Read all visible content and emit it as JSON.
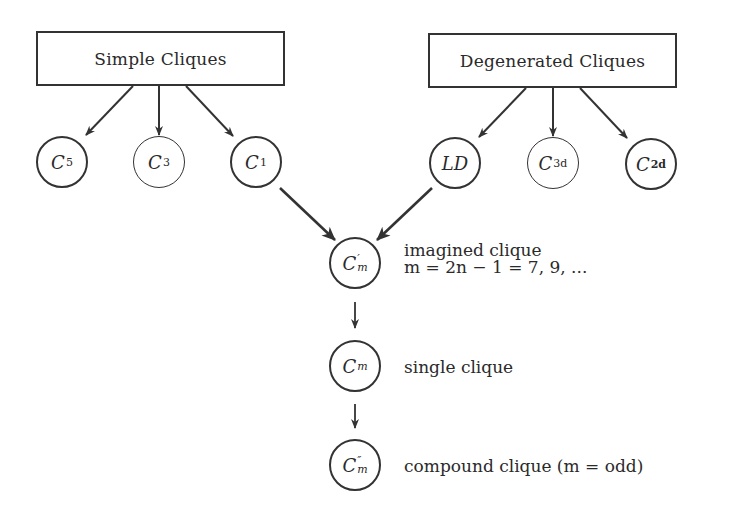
{
  "categories": [
    {
      "id": "simple",
      "label": "Simple Cliques"
    },
    {
      "id": "degenerated",
      "label": "Degenerated Cliques"
    }
  ],
  "simple_nodes": [
    {
      "id": "C5",
      "base": "C",
      "sub": "5"
    },
    {
      "id": "C3",
      "base": "C",
      "sub": "3"
    },
    {
      "id": "C1",
      "base": "C",
      "sub": "1"
    }
  ],
  "degenerated_nodes": [
    {
      "id": "LD",
      "base": "LD",
      "sub": ""
    },
    {
      "id": "C3d",
      "base": "C",
      "sub": "3d"
    },
    {
      "id": "C2d",
      "base": "C",
      "sub": "2d"
    }
  ],
  "chain": [
    {
      "id": "Cm_prime",
      "base": "C",
      "prime": "′",
      "sub": "m",
      "label_line1": "imagined clique",
      "label_line2": "m = 2n − 1 = 7, 9, ..."
    },
    {
      "id": "Cm",
      "base": "C",
      "prime": "",
      "sub": "m",
      "label_line1": "single clique"
    },
    {
      "id": "Cm_dprime",
      "base": "C",
      "prime": "″",
      "sub": "m",
      "label_line1": "compound clique (m = odd)"
    }
  ],
  "edges": [
    {
      "from": "Simple Cliques",
      "to": "C5"
    },
    {
      "from": "Simple Cliques",
      "to": "C3"
    },
    {
      "from": "Simple Cliques",
      "to": "C1"
    },
    {
      "from": "Degenerated Cliques",
      "to": "LD"
    },
    {
      "from": "Degenerated Cliques",
      "to": "C3d"
    },
    {
      "from": "Degenerated Cliques",
      "to": "C2d"
    },
    {
      "from": "C1",
      "to": "Cm_prime"
    },
    {
      "from": "LD",
      "to": "Cm_prime"
    },
    {
      "from": "Cm_prime",
      "to": "Cm"
    },
    {
      "from": "Cm",
      "to": "Cm_dprime"
    }
  ],
  "colors": {
    "stroke": "#333333",
    "text": "#2a2a2a",
    "background": "#ffffff"
  }
}
